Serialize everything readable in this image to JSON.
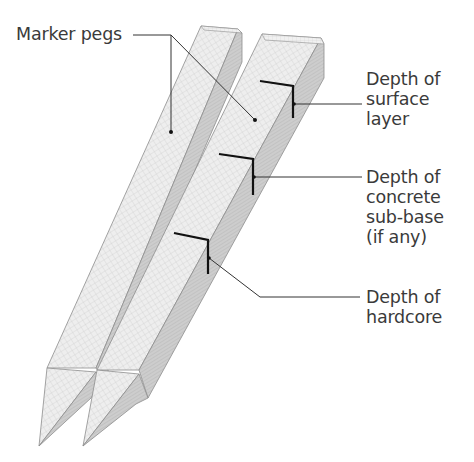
{
  "diagram": {
    "colors": {
      "background": "#ffffff",
      "text": "#3a3a3a",
      "leader_line": "#333333",
      "depth_mark": "#111111",
      "peg_face_light": "#ececec",
      "peg_face_dark": "#c9c9c9",
      "peg_edge": "#8a8a8a",
      "grid": "#bdbdbd"
    },
    "labels": {
      "marker_pegs": "Marker pegs",
      "surface_layer": "Depth of\nsurface\nlayer",
      "concrete_sub_base": "Depth of\nconcrete\nsub-base\n(if any)",
      "hardcore": "Depth of\nhardcore"
    },
    "pegs": [
      {
        "name": "left-peg"
      },
      {
        "name": "right-peg"
      }
    ],
    "depth_marks": [
      "surface layer",
      "concrete sub-base",
      "hardcore"
    ]
  }
}
